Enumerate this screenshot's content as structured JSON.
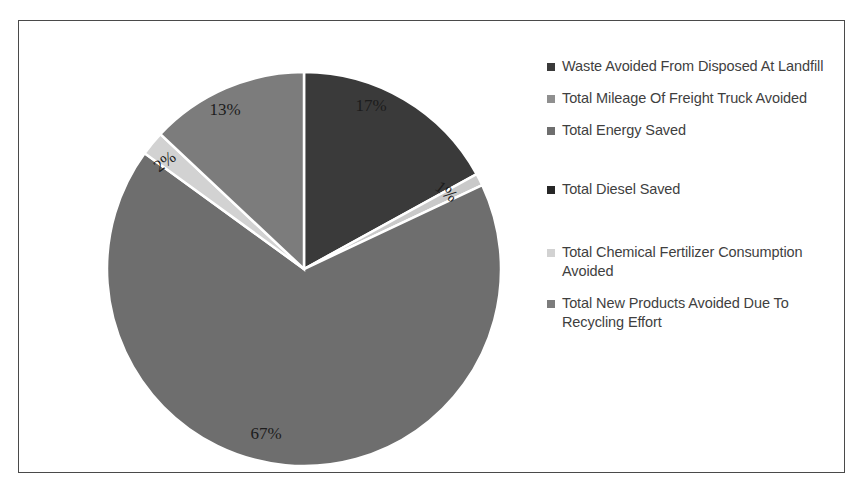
{
  "chart_data": {
    "type": "pie",
    "title": "",
    "legend_position": "right",
    "categories": [
      "Waste Avoided From Disposed At Landfill",
      "Total Mileage Of Freight Truck Avoided",
      "Total Energy Saved",
      "Total Diesel Saved",
      "Total Chemical Fertilizer Consumption Avoided",
      "Total New Products Avoided Due To Recycling Effort"
    ],
    "values": [
      17,
      1,
      67,
      0,
      2,
      13
    ],
    "value_labels": [
      "17%",
      "1%",
      "67%",
      "",
      "2%",
      "13%"
    ],
    "colors": [
      "#3a3a3a",
      "#c9c9c9",
      "#6e6e6e",
      "#262626",
      "#d2d2d2",
      "#7c7c7c"
    ],
    "units": "percent",
    "start_angle_deg": 0,
    "direction": "clockwise"
  },
  "frame": {
    "border_color": "#4a4a4a",
    "background": "#ffffff"
  },
  "pie": {
    "center_x": 285,
    "center_y": 248,
    "radius": 197,
    "separator_color": "#ffffff",
    "slices": [
      {
        "label": "17%",
        "value": 17,
        "color": "#3a3a3a",
        "legend": "Waste Avoided From Disposed At Landfill",
        "label_x": 352,
        "label_y": 90,
        "rotate": 0
      },
      {
        "label": "1%",
        "value": 1,
        "color": "#c9c9c9",
        "legend": "Total Mileage Of Freight Truck Avoided",
        "label_x": 424,
        "label_y": 175,
        "rotate": 38
      },
      {
        "label": "67%",
        "value": 67,
        "color": "#6e6e6e",
        "legend": "Total Energy Saved",
        "label_x": 247,
        "label_y": 418,
        "rotate": 0
      },
      {
        "label": "",
        "value": 0,
        "color": "#262626",
        "legend": "Total Diesel Saved",
        "label_x": 0,
        "label_y": 0,
        "rotate": 0
      },
      {
        "label": "2%",
        "value": 2,
        "color": "#d2d2d2",
        "legend": "Total Chemical Fertilizer Consumption Avoided",
        "label_x": 149,
        "label_y": 145,
        "rotate": -37
      },
      {
        "label": "13%",
        "value": 13,
        "color": "#7c7c7c",
        "legend": "Total New Products Avoided Due To Recycling Effort",
        "label_x": 206,
        "label_y": 94,
        "rotate": 0
      }
    ]
  },
  "legend": {
    "items": [
      {
        "label": "Waste Avoided From Disposed At Landfill",
        "color": "#3a3a3a",
        "gap_after": 13
      },
      {
        "label": "Total Mileage Of Freight Truck Avoided",
        "color": "#8f8f8f",
        "gap_after": 13
      },
      {
        "label": "Total Energy Saved",
        "color": "#6e6e6e",
        "gap_after": 40
      },
      {
        "label": "Total Diesel Saved",
        "color": "#262626",
        "gap_after": 44
      },
      {
        "label": "Total Chemical Fertilizer Consumption Avoided",
        "color": "#d2d2d2",
        "gap_after": 13
      },
      {
        "label": "Total New Products Avoided Due To Recycling Effort",
        "color": "#7c7c7c",
        "gap_after": 0
      }
    ]
  }
}
